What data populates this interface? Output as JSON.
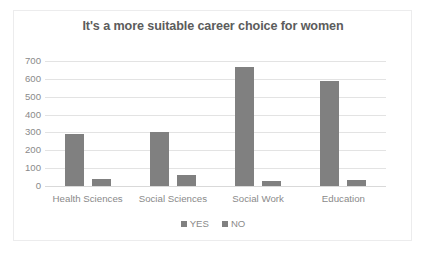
{
  "chart_data": {
    "type": "bar",
    "title": "It's a more suitable career choice for women",
    "xlabel": "",
    "ylabel": "",
    "categories": [
      "Health Sciences",
      "Social Sciences",
      "Social Work",
      "Education"
    ],
    "series": [
      {
        "name": "YES",
        "values": [
          290,
          300,
          665,
          590
        ],
        "color": "#808080"
      },
      {
        "name": "NO",
        "values": [
          38,
          62,
          30,
          35
        ],
        "color": "#808080"
      }
    ],
    "ylim": [
      0,
      700
    ],
    "ytick_step": 100,
    "yticks": [
      700,
      600,
      500,
      400,
      300,
      200,
      100,
      0
    ],
    "ytick_labels": [
      "700",
      "600",
      "500",
      "400",
      "300",
      "200",
      "100",
      "0"
    ],
    "grid": true,
    "grid_axis": "y",
    "legend_position": "bottom-center",
    "legend_entries": [
      "YES",
      "NO"
    ],
    "bar_color": "#808080",
    "gridline_color": "#e3e3e3",
    "title_color": "#5c5c5c",
    "tick_label_color": "#8a8a8a",
    "background_color": "#ffffff",
    "frame_color": "#ececed"
  }
}
